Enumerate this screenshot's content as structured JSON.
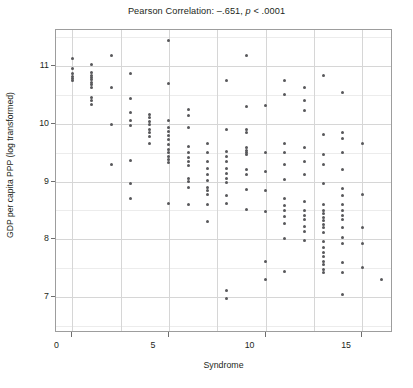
{
  "chart_data": {
    "type": "scatter",
    "title": "Pearson Correlation: –.651, p < .0001",
    "title_prefix": "Pearson Correlation: –.651, ",
    "title_italic": "p",
    "title_suffix": " < .0001",
    "xlabel": "Syndrome",
    "ylabel": "GDP per capita PPP (log transformed)",
    "xlim": [
      -0.85,
      16.6
    ],
    "ylim": [
      6.38,
      11.62
    ],
    "xticks": [
      0,
      5,
      10,
      15
    ],
    "xtick_labels": [
      "0",
      "5",
      "10",
      "15"
    ],
    "yticks": [
      7,
      8,
      9,
      10,
      11
    ],
    "ytick_labels": [
      "7",
      "8",
      "9",
      "10",
      "11"
    ],
    "grid": "major horizontal and vertical, light gray, plus faint minor horizontal lines",
    "legend": "none",
    "marker": {
      "shape": "circle",
      "size_px": 3,
      "color": "#58585b"
    },
    "correlation_r": -0.651,
    "p_value_text": "p < .0001",
    "points": [
      [
        0,
        11.12
      ],
      [
        0,
        10.95
      ],
      [
        0,
        10.86
      ],
      [
        0,
        10.82
      ],
      [
        0,
        10.78
      ],
      [
        0,
        10.74
      ],
      [
        1,
        11.02
      ],
      [
        1,
        10.88
      ],
      [
        1,
        10.84
      ],
      [
        1,
        10.8
      ],
      [
        1,
        10.76
      ],
      [
        1,
        10.72
      ],
      [
        1,
        10.68
      ],
      [
        1,
        10.62
      ],
      [
        1,
        10.46
      ],
      [
        1,
        10.4
      ],
      [
        1,
        10.34
      ],
      [
        2,
        11.18
      ],
      [
        2,
        10.62
      ],
      [
        2,
        9.98
      ],
      [
        2,
        9.3
      ],
      [
        3,
        10.86
      ],
      [
        3,
        10.44
      ],
      [
        3,
        10.2
      ],
      [
        3,
        10.06
      ],
      [
        3,
        9.96
      ],
      [
        3,
        9.36
      ],
      [
        3,
        8.96
      ],
      [
        3,
        8.7
      ],
      [
        4,
        10.16
      ],
      [
        4,
        10.1
      ],
      [
        4,
        10.04
      ],
      [
        4,
        9.98
      ],
      [
        4,
        9.9
      ],
      [
        4,
        9.84
      ],
      [
        4,
        9.78
      ],
      [
        4,
        9.66
      ],
      [
        5,
        11.44
      ],
      [
        5,
        10.7
      ],
      [
        5,
        10.06
      ],
      [
        5,
        9.94
      ],
      [
        5,
        9.86
      ],
      [
        5,
        9.8
      ],
      [
        5,
        9.72
      ],
      [
        5,
        9.64
      ],
      [
        5,
        9.56
      ],
      [
        5,
        9.5
      ],
      [
        5,
        9.44
      ],
      [
        5,
        9.38
      ],
      [
        5,
        9.32
      ],
      [
        5,
        8.62
      ],
      [
        6,
        10.24
      ],
      [
        6,
        10.14
      ],
      [
        6,
        9.94
      ],
      [
        6,
        9.6
      ],
      [
        6,
        9.5
      ],
      [
        6,
        9.42
      ],
      [
        6,
        9.34
      ],
      [
        6,
        9.28
      ],
      [
        6,
        9.06
      ],
      [
        6,
        9.0
      ],
      [
        6,
        8.9
      ],
      [
        6,
        8.6
      ],
      [
        7,
        9.66
      ],
      [
        7,
        9.5
      ],
      [
        7,
        9.34
      ],
      [
        7,
        9.22
      ],
      [
        7,
        9.12
      ],
      [
        7,
        9.02
      ],
      [
        7,
        8.9
      ],
      [
        7,
        8.84
      ],
      [
        7,
        8.78
      ],
      [
        7,
        8.6
      ],
      [
        7,
        8.3
      ],
      [
        8,
        10.74
      ],
      [
        8,
        9.9
      ],
      [
        8,
        9.52
      ],
      [
        8,
        9.44
      ],
      [
        8,
        9.34
      ],
      [
        8,
        9.22
      ],
      [
        8,
        9.14
      ],
      [
        8,
        9.06
      ],
      [
        8,
        8.98
      ],
      [
        8,
        8.76
      ],
      [
        8,
        8.62
      ],
      [
        8,
        7.12
      ],
      [
        8,
        6.98
      ],
      [
        9,
        11.18
      ],
      [
        9,
        10.3
      ],
      [
        9,
        9.9
      ],
      [
        9,
        9.84
      ],
      [
        9,
        9.58
      ],
      [
        9,
        9.54
      ],
      [
        9,
        9.5
      ],
      [
        9,
        9.46
      ],
      [
        9,
        9.2
      ],
      [
        9,
        9.12
      ],
      [
        9,
        8.86
      ],
      [
        9,
        8.52
      ],
      [
        10,
        10.32
      ],
      [
        10,
        9.5
      ],
      [
        10,
        9.18
      ],
      [
        10,
        8.84
      ],
      [
        10,
        8.48
      ],
      [
        10,
        7.62
      ],
      [
        10,
        7.3
      ],
      [
        11,
        10.74
      ],
      [
        11,
        10.5
      ],
      [
        11,
        9.66
      ],
      [
        11,
        9.5
      ],
      [
        11,
        9.3
      ],
      [
        11,
        9.04
      ],
      [
        11,
        8.7
      ],
      [
        11,
        8.58
      ],
      [
        11,
        8.5
      ],
      [
        11,
        8.4
      ],
      [
        11,
        8.28
      ],
      [
        11,
        8.02
      ],
      [
        11,
        7.44
      ],
      [
        12,
        10.62
      ],
      [
        12,
        10.4
      ],
      [
        12,
        10.22
      ],
      [
        12,
        9.58
      ],
      [
        12,
        9.34
      ],
      [
        12,
        9.12
      ],
      [
        12,
        8.66
      ],
      [
        12,
        8.5
      ],
      [
        12,
        8.42
      ],
      [
        12,
        8.34
      ],
      [
        12,
        8.22
      ],
      [
        12,
        8.14
      ],
      [
        12,
        7.98
      ],
      [
        13,
        10.84
      ],
      [
        13,
        9.82
      ],
      [
        13,
        9.46
      ],
      [
        13,
        9.3
      ],
      [
        13,
        8.96
      ],
      [
        13,
        8.6
      ],
      [
        13,
        8.5
      ],
      [
        13,
        8.44
      ],
      [
        13,
        8.38
      ],
      [
        13,
        8.32
      ],
      [
        13,
        8.26
      ],
      [
        13,
        8.2
      ],
      [
        13,
        8.12
      ],
      [
        13,
        7.96
      ],
      [
        13,
        7.86
      ],
      [
        13,
        7.78
      ],
      [
        13,
        7.7
      ],
      [
        13,
        7.62
      ],
      [
        13,
        7.56
      ],
      [
        13,
        7.48
      ],
      [
        13,
        7.42
      ],
      [
        14,
        10.54
      ],
      [
        14,
        9.84
      ],
      [
        14,
        9.74
      ],
      [
        14,
        9.5
      ],
      [
        14,
        9.2
      ],
      [
        14,
        8.88
      ],
      [
        14,
        8.76
      ],
      [
        14,
        8.6
      ],
      [
        14,
        8.5
      ],
      [
        14,
        8.42
      ],
      [
        14,
        8.34
      ],
      [
        14,
        8.2
      ],
      [
        14,
        8.04
      ],
      [
        14,
        7.92
      ],
      [
        14,
        7.6
      ],
      [
        14,
        7.42
      ],
      [
        14,
        7.04
      ],
      [
        15,
        9.66
      ],
      [
        15,
        8.78
      ],
      [
        15,
        8.2
      ],
      [
        15,
        7.92
      ],
      [
        15,
        7.52
      ],
      [
        16,
        7.3
      ]
    ]
  }
}
